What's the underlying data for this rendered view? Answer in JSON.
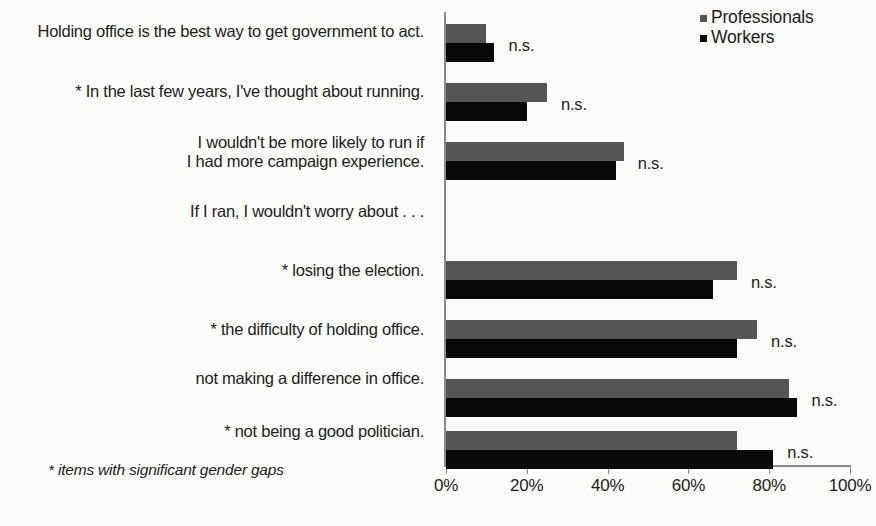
{
  "legend": {
    "items": [
      {
        "label": "Professionals",
        "color": "#555554",
        "icon": "square-marker-icon"
      },
      {
        "label": "Workers",
        "color": "#090909",
        "icon": "square-marker-icon"
      }
    ]
  },
  "footnote": "* items with significant gender gaps",
  "axis": {
    "tick_labels": [
      "0%",
      "20%",
      "40%",
      "60%",
      "80%",
      "100%"
    ],
    "tick_values": [
      0,
      20,
      40,
      60,
      80,
      100
    ]
  },
  "chart_data": {
    "type": "bar",
    "orientation": "horizontal",
    "title": "",
    "xlabel": "",
    "ylabel": "",
    "xlim": [
      0,
      100
    ],
    "grid": false,
    "legend_position": "top-right",
    "categories": [
      "Holding office is the best way to get government to act.",
      "* In the last few years, I've thought about running.",
      "I wouldn't be more likely to run if I had more campaign experience.",
      "If I ran, I wouldn't worry about . . .",
      "* losing the election.",
      "* the difficulty of holding office.",
      "not making a difference in office.",
      "* not being a good politician."
    ],
    "series": [
      {
        "name": "Professionals",
        "color": "#555554",
        "values": [
          10,
          25,
          44,
          null,
          72,
          77,
          85,
          72
        ]
      },
      {
        "name": "Workers",
        "color": "#090909",
        "values": [
          12,
          20,
          42,
          null,
          66,
          72,
          87,
          81
        ]
      }
    ],
    "annotations": [
      "n.s.",
      "n.s.",
      "n.s.",
      "",
      "n.s.",
      "n.s.",
      "n.s.",
      "n.s."
    ]
  },
  "rows": [
    {
      "label_line1": "Holding office is the best way to get government to act.",
      "label_line2": "",
      "professionals": 10,
      "workers": 12,
      "note": "n.s.",
      "has_bars": true
    },
    {
      "label_line1": "* In the last few years, I've thought about running.",
      "label_line2": "",
      "professionals": 25,
      "workers": 20,
      "note": "n.s.",
      "has_bars": true
    },
    {
      "label_line1": "I wouldn't be more likely to run if",
      "label_line2": "I had more campaign experience.",
      "professionals": 44,
      "workers": 42,
      "note": "n.s.",
      "has_bars": true
    },
    {
      "label_line1": "If I ran, I wouldn't worry about . . .",
      "label_line2": "",
      "professionals": null,
      "workers": null,
      "note": "",
      "has_bars": false
    },
    {
      "label_line1": "* losing the election.",
      "label_line2": "",
      "professionals": 72,
      "workers": 66,
      "note": "n.s.",
      "has_bars": true
    },
    {
      "label_line1": "* the difficulty of holding office.",
      "label_line2": "",
      "professionals": 77,
      "workers": 72,
      "note": "n.s.",
      "has_bars": true
    },
    {
      "label_line1": "not making a difference in office.",
      "label_line2": "",
      "professionals": 85,
      "workers": 87,
      "note": "n.s.",
      "has_bars": true
    },
    {
      "label_line1": "* not being a good politician.",
      "label_line2": "",
      "professionals": 72,
      "workers": 81,
      "note": "n.s.",
      "has_bars": true
    }
  ]
}
